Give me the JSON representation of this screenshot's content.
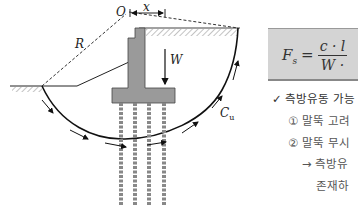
{
  "figure": {
    "labels": {
      "origin": "O",
      "offset": "x",
      "radius": "R",
      "weight": "W",
      "cohesion": "C",
      "cohesion_sub": "u"
    },
    "colors": {
      "structure_fill": "#9a9a9a",
      "line": "#1a1a1a",
      "formula_bg": "#d4d4d4"
    }
  },
  "formula": {
    "lhs": "F",
    "lhs_sub": "s",
    "equals": "=",
    "numerator": "c · l",
    "denominator": "W ·"
  },
  "notes": {
    "heading_mark": "✓",
    "heading": "측방유동 가능",
    "items": [
      {
        "marker": "①",
        "text": "말뚝 고려"
      },
      {
        "marker": "②",
        "text": "말뚝 무시"
      }
    ],
    "result_arrow": "→",
    "result_line1": "측방유",
    "result_line2": "존재하"
  }
}
